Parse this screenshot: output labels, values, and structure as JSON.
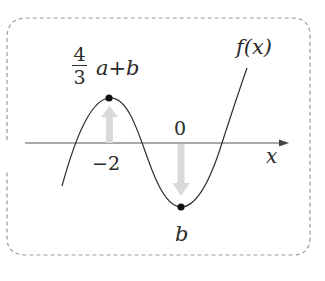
{
  "diagram": {
    "type": "cubic-function-graph",
    "function_label": "f(x)",
    "axis_label": "x",
    "origin_label": "0",
    "local_max": {
      "x_label": "−2",
      "value_label": {
        "fraction_numerator": "4",
        "fraction_denominator": "3",
        "rest": "a+b"
      }
    },
    "local_min": {
      "x_label": "0",
      "value_label": "b"
    },
    "arrows": [
      {
        "name": "up-arrow",
        "direction": "up",
        "at": "x=-2"
      },
      {
        "name": "down-arrow",
        "direction": "down",
        "at": "x=0"
      }
    ]
  },
  "colors": {
    "curve": "#2f2f2f",
    "axis": "#555555",
    "frame": "#9a9a9a",
    "arrow_fill": "#d9d9d9",
    "dot": "#111111",
    "text": "#2a2a2a"
  }
}
